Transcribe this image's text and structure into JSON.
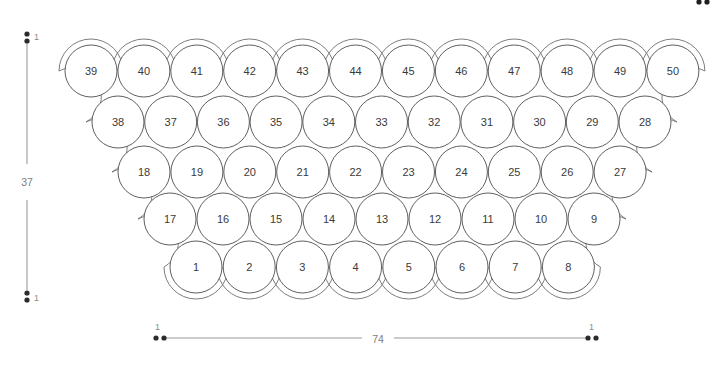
{
  "canvas": {
    "width": 727,
    "height": 370,
    "background": "#ffffff"
  },
  "diagram": {
    "name": "circle-packing-trapezoid",
    "circle_radius_px": 26,
    "stroke_color": "#4d4d4d",
    "hull_stroke_color": "#6e6e6e",
    "rows": [
      {
        "index": 0,
        "count": 12,
        "y": 71,
        "x_start": 91,
        "x_step": 52.9,
        "labels": [
          "39",
          "40",
          "41",
          "42",
          "43",
          "44",
          "45",
          "46",
          "47",
          "48",
          "49",
          "50"
        ]
      },
      {
        "index": 1,
        "count": 11,
        "y": 122,
        "x_start": 118,
        "x_step": 52.7,
        "labels": [
          "38",
          "37",
          "36",
          "35",
          "34",
          "33",
          "32",
          "31",
          "30",
          "29",
          "28"
        ]
      },
      {
        "index": 2,
        "count": 10,
        "y": 172,
        "x_start": 144,
        "x_step": 52.9,
        "labels": [
          "18",
          "19",
          "20",
          "21",
          "22",
          "23",
          "24",
          "25",
          "26",
          "27"
        ]
      },
      {
        "index": 3,
        "count": 9,
        "y": 219,
        "x_start": 170,
        "x_step": 53.0,
        "labels": [
          "17",
          "16",
          "15",
          "14",
          "13",
          "12",
          "11",
          "10",
          "9"
        ]
      },
      {
        "index": 4,
        "count": 8,
        "y": 267,
        "x_start": 196,
        "x_step": 53.2,
        "labels": [
          "1",
          "2",
          "3",
          "4",
          "5",
          "6",
          "7",
          "8"
        ]
      }
    ]
  },
  "dimensions": {
    "vertical": {
      "name": "height-dimension",
      "value": "37",
      "top_tick_label": "1",
      "bottom_tick_label": "1",
      "x": 27,
      "y_top": 38,
      "y_bottom": 296,
      "label_y": 182
    },
    "horizontal": {
      "name": "width-dimension",
      "value": "74",
      "left_tick_label": "1",
      "right_tick_label": "1",
      "y": 338,
      "x_left": 160,
      "x_right": 592,
      "label_x": 378
    }
  },
  "corner_marks": {
    "name": "top-right-marks",
    "dots": [
      {
        "cx": 699,
        "cy": 2,
        "r": 2.6
      },
      {
        "cx": 707,
        "cy": 2,
        "r": 2.6
      }
    ]
  },
  "chart_data": {
    "type": "scatter",
    "title": "",
    "xlabel": "74",
    "ylabel": "37",
    "legend": [],
    "total_circles": 50,
    "row_counts": [
      12,
      11,
      10,
      9,
      8
    ],
    "circle_labels_in_order": [
      "39",
      "40",
      "41",
      "42",
      "43",
      "44",
      "45",
      "46",
      "47",
      "48",
      "49",
      "50",
      "38",
      "37",
      "36",
      "35",
      "34",
      "33",
      "32",
      "31",
      "30",
      "29",
      "28",
      "18",
      "19",
      "20",
      "21",
      "22",
      "23",
      "24",
      "25",
      "26",
      "27",
      "17",
      "16",
      "15",
      "14",
      "13",
      "12",
      "11",
      "10",
      "9",
      "1",
      "2",
      "3",
      "4",
      "5",
      "6",
      "7",
      "8"
    ],
    "x": [
      91,
      143.9,
      196.8,
      249.7,
      302.6,
      355.5,
      408.4,
      461.3,
      514.2,
      567.1,
      620,
      672.9,
      118,
      170.7,
      223.4,
      276.1,
      328.8,
      381.5,
      434.2,
      486.9,
      539.6,
      592.3,
      645,
      144,
      196.9,
      249.8,
      302.7,
      355.6,
      408.5,
      461.4,
      514.3,
      567.2,
      620.1,
      170,
      223,
      276,
      329,
      382,
      435,
      488,
      541,
      594,
      196,
      249.2,
      302.4,
      355.6,
      408.8,
      462,
      515.2,
      568.4
    ],
    "y": [
      71,
      71,
      71,
      71,
      71,
      71,
      71,
      71,
      71,
      71,
      71,
      71,
      122,
      122,
      122,
      122,
      122,
      122,
      122,
      122,
      122,
      122,
      122,
      172,
      172,
      172,
      172,
      172,
      172,
      172,
      172,
      172,
      172,
      219,
      219,
      219,
      219,
      219,
      219,
      219,
      219,
      219,
      267,
      267,
      267,
      267,
      267,
      267,
      267,
      267
    ],
    "xlim": [
      0,
      727
    ],
    "ylim": [
      0,
      370
    ],
    "grid": false
  }
}
